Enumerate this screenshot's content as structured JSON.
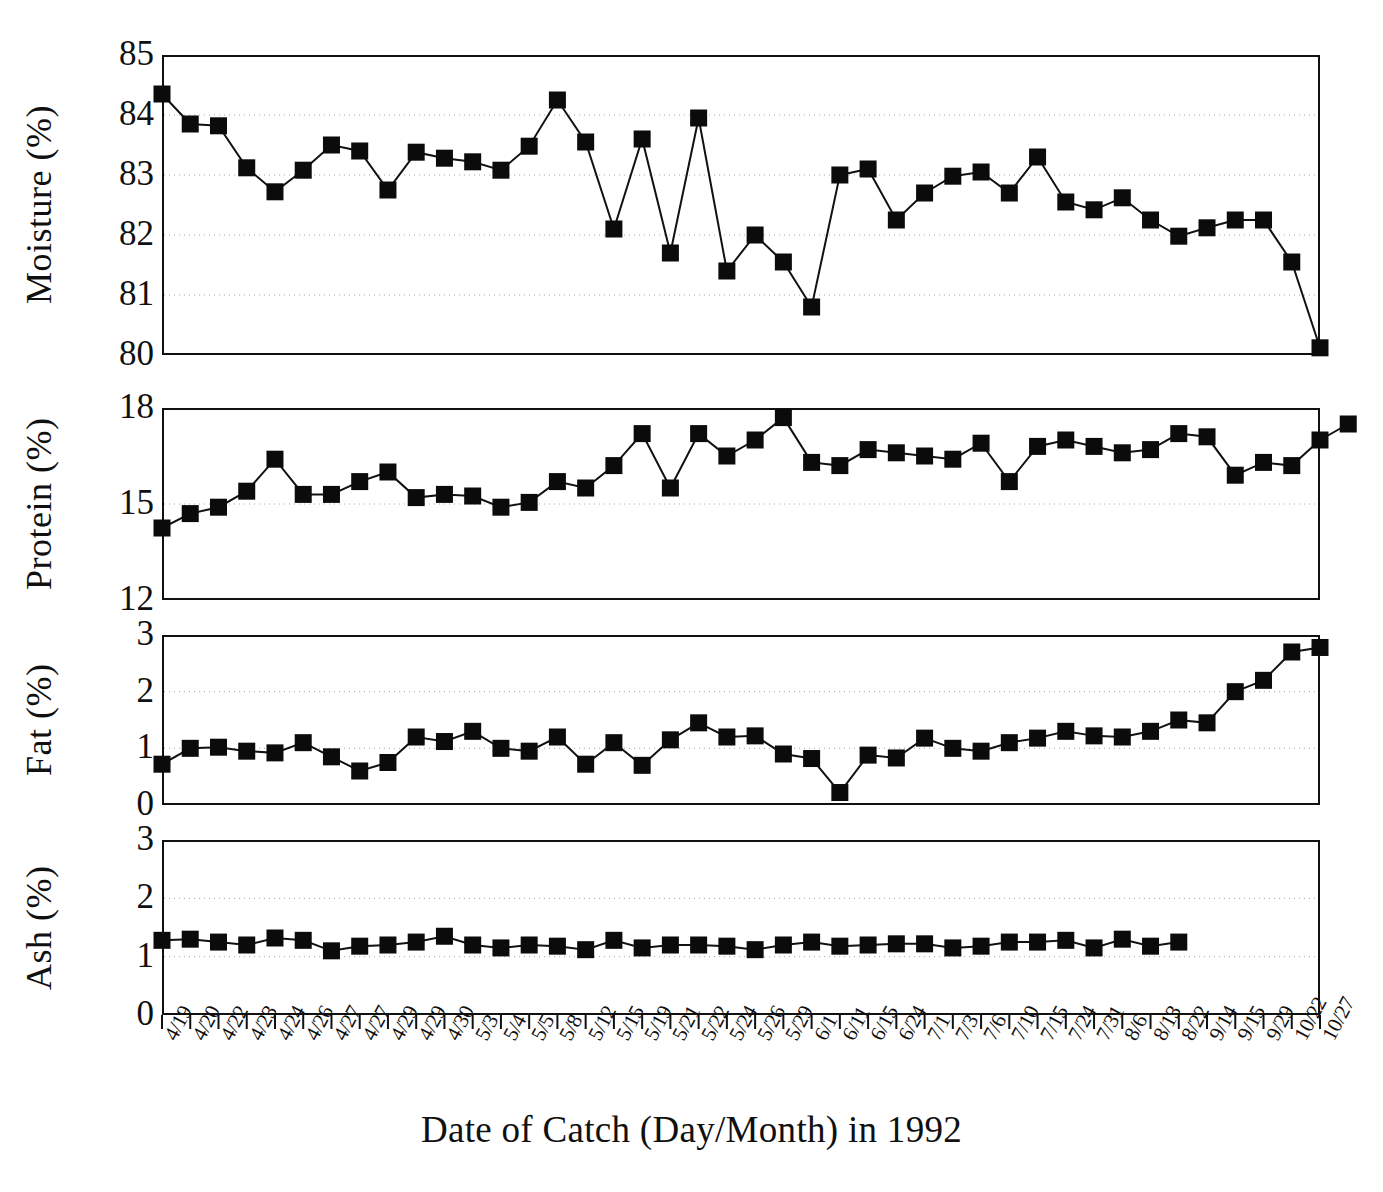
{
  "figure": {
    "xaxis_title": "Date of Catch (Day/Month) in 1992",
    "ink_color": "#111111",
    "grid_color": "#9a9a9a",
    "background": "#ffffff"
  },
  "axis": {
    "categories": [
      "4/19",
      "4/20",
      "4/22",
      "4/23",
      "4/24",
      "4/26",
      "4/27",
      "4/27",
      "4/29",
      "4/29",
      "4/30",
      "5/3",
      "5/4",
      "5/5",
      "5/8",
      "5/12",
      "5/15",
      "5/19",
      "5/21",
      "5/22",
      "5/24",
      "5/26",
      "5/29",
      "6/1",
      "6/11",
      "6/15",
      "6/24",
      "7/1",
      "7/3",
      "7/6",
      "7/10",
      "7/15",
      "7/24",
      "7/31",
      "8/6",
      "8/13",
      "8/22",
      "9/14",
      "9/15",
      "9/29",
      "10/22",
      "10/27"
    ]
  },
  "panels": [
    {
      "id": "moisture",
      "ylabel": "Moisture (%)",
      "yticks": [
        "85",
        "84",
        "83",
        "82",
        "81",
        "80"
      ],
      "ylim": [
        80,
        85
      ],
      "gridvalues": [
        84,
        83,
        82,
        81
      ]
    },
    {
      "id": "protein",
      "ylabel": "Protein (%)",
      "yticks": [
        "18",
        "15",
        "12"
      ],
      "ylim": [
        12,
        18
      ],
      "gridvalues": [
        15
      ]
    },
    {
      "id": "fat",
      "ylabel": "Fat (%)",
      "yticks": [
        "3",
        "2",
        "1",
        "0"
      ],
      "ylim": [
        0,
        3
      ],
      "gridvalues": [
        2,
        1
      ]
    },
    {
      "id": "ash",
      "ylabel": "Ash (%)",
      "yticks": [
        "3",
        "2",
        "1",
        "0"
      ],
      "ylim": [
        0,
        3
      ],
      "gridvalues": [
        2,
        1
      ]
    }
  ],
  "chart_data": {
    "type": "line",
    "title": "",
    "xlabel": "Date of Catch (Day/Month) in 1992",
    "grid": true,
    "legend": "none",
    "marker": "filled-square",
    "x": [
      "4/19",
      "4/20",
      "4/22",
      "4/23",
      "4/24",
      "4/26",
      "4/27",
      "4/27",
      "4/29",
      "4/29",
      "4/30",
      "5/3",
      "5/4",
      "5/5",
      "5/8",
      "5/12",
      "5/15",
      "5/19",
      "5/21",
      "5/22",
      "5/24",
      "5/26",
      "5/29",
      "6/1",
      "6/11",
      "6/15",
      "6/24",
      "7/1",
      "7/3",
      "7/6",
      "7/10",
      "7/15",
      "7/24",
      "7/31",
      "8/6",
      "8/13",
      "8/22",
      "9/14",
      "9/15",
      "9/29",
      "10/22",
      "10/27"
    ],
    "panels": [
      {
        "name": "Moisture (%)",
        "ylabel": "Moisture (%)",
        "ylim": [
          80,
          85
        ],
        "yticks": [
          80,
          81,
          82,
          83,
          84,
          85
        ],
        "values": [
          84.35,
          83.85,
          83.82,
          83.12,
          82.72,
          83.08,
          83.5,
          83.4,
          82.75,
          83.38,
          83.28,
          83.22,
          83.08,
          83.48,
          84.25,
          83.55,
          82.1,
          83.6,
          81.7,
          83.95,
          81.4,
          82.0,
          81.55,
          80.8,
          83.0,
          83.1,
          82.25,
          82.7,
          82.98,
          83.05,
          82.7,
          83.3,
          82.55,
          82.42,
          82.62,
          82.25,
          81.98,
          82.12,
          82.25,
          82.25,
          81.55,
          80.12
        ]
      },
      {
        "name": "Protein (%)",
        "ylabel": "Protein (%)",
        "ylim": [
          12,
          18
        ],
        "yticks": [
          12,
          15,
          18
        ],
        "values": [
          14.25,
          14.7,
          14.9,
          15.4,
          16.4,
          15.3,
          15.3,
          15.7,
          16.0,
          15.2,
          15.3,
          15.25,
          14.9,
          15.05,
          15.7,
          15.5,
          16.2,
          17.2,
          15.5,
          17.2,
          16.5,
          17.0,
          17.7,
          16.3,
          16.2,
          16.7,
          16.6,
          16.5,
          16.4,
          16.9,
          15.7,
          16.8,
          17.0,
          16.8,
          16.6,
          16.7,
          17.2,
          17.1,
          15.9,
          16.3,
          16.2,
          17.0,
          17.5
        ]
      },
      {
        "name": "Fat (%)",
        "ylabel": "Fat (%)",
        "ylim": [
          0,
          3
        ],
        "yticks": [
          0,
          1,
          2,
          3
        ],
        "values": [
          0.72,
          1.0,
          1.02,
          0.95,
          0.92,
          1.1,
          0.85,
          0.6,
          0.75,
          1.2,
          1.12,
          1.3,
          1.0,
          0.95,
          1.2,
          0.72,
          1.1,
          0.7,
          1.15,
          1.45,
          1.2,
          1.22,
          0.9,
          0.82,
          0.22,
          0.88,
          0.83,
          1.18,
          1.0,
          0.95,
          1.1,
          1.18,
          1.3,
          1.22,
          1.2,
          1.3,
          1.5,
          1.45,
          2.0,
          2.2,
          2.7,
          2.78
        ]
      },
      {
        "name": "Ash (%)",
        "ylabel": "Ash (%)",
        "ylim": [
          0,
          3
        ],
        "yticks": [
          0,
          1,
          2,
          3
        ],
        "values": [
          1.28,
          1.3,
          1.25,
          1.2,
          1.32,
          1.28,
          1.1,
          1.18,
          1.2,
          1.25,
          1.35,
          1.2,
          1.15,
          1.2,
          1.18,
          1.12,
          1.28,
          1.15,
          1.2,
          1.2,
          1.18,
          1.12,
          1.2,
          1.25,
          1.18,
          1.2,
          1.22,
          1.22,
          1.15,
          1.18,
          1.25,
          1.25,
          1.28,
          1.15,
          1.3,
          1.18,
          1.25
        ]
      }
    ]
  }
}
